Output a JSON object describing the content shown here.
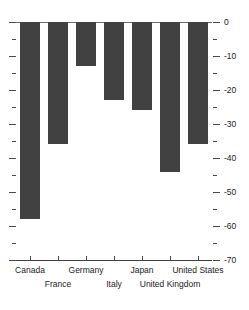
{
  "chart_data": {
    "type": "bar",
    "title": "",
    "xlabel": "",
    "ylabel": "",
    "orientation": "vertical",
    "grid": false,
    "legend": false,
    "categories": [
      "Canada",
      "France",
      "Germany",
      "Italy",
      "Japan",
      "United Kingdom",
      "United States"
    ],
    "values": [
      -58,
      -36,
      -13,
      -23,
      -26,
      -44,
      -36
    ],
    "ylim": [
      -70,
      0
    ],
    "y_major_ticks": [
      0,
      -10,
      -20,
      -30,
      -40,
      -50,
      -60,
      -70
    ],
    "y_minor_ticks": [
      -5,
      -15,
      -25,
      -35,
      -45,
      -55,
      -65
    ],
    "y_tick_labels": [
      "0",
      "-10",
      "-20",
      "-30",
      "-40",
      "-50",
      "-60",
      "-70"
    ],
    "y_axis_position": "right",
    "x_label_rows": [
      [
        "Canada",
        "Germany",
        "Japan",
        "United States"
      ],
      [
        "France",
        "Italy",
        "United Kingdom"
      ]
    ],
    "bar_color": "#414141",
    "axis_color": "#4a4a4a",
    "background_color": "#ffffff"
  }
}
